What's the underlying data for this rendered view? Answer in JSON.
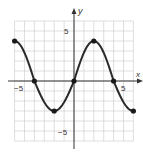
{
  "chart_data": {
    "type": "line",
    "title": "",
    "xlabel": "x",
    "ylabel": "y",
    "xlim": [
      -6,
      6
    ],
    "ylim": [
      -6,
      6
    ],
    "grid": true,
    "x_tick_labels": [
      {
        "value": -5,
        "label": "-5"
      },
      {
        "value": 5,
        "label": "5"
      }
    ],
    "y_tick_labels": [
      {
        "value": 5,
        "label": "5"
      },
      {
        "value": -5,
        "label": "-5"
      }
    ],
    "series": [
      {
        "name": "f(x)",
        "style": "smooth periodic curve",
        "points": [
          {
            "x": -6,
            "y": 4
          },
          {
            "x": -4,
            "y": 0
          },
          {
            "x": -2,
            "y": -3
          },
          {
            "x": 0,
            "y": 0
          },
          {
            "x": 2,
            "y": 4
          },
          {
            "x": 4,
            "y": 0
          },
          {
            "x": 6,
            "y": -3
          }
        ]
      }
    ],
    "marked_points": [
      {
        "x": -6,
        "y": 4
      },
      {
        "x": -4,
        "y": 0
      },
      {
        "x": -2,
        "y": -3
      },
      {
        "x": 0,
        "y": 0
      },
      {
        "x": 2,
        "y": 4
      },
      {
        "x": 4,
        "y": 0
      },
      {
        "x": 6,
        "y": -3
      }
    ]
  },
  "labels": {
    "x_axis": "x",
    "y_axis": "y",
    "x_neg5": "−5",
    "x_pos5": "5",
    "y_pos5": "5",
    "y_neg5": "−5"
  },
  "colors": {
    "curve": "#2a2a2a",
    "grid": "#c9c9c9",
    "axis": "#333333",
    "background": "#ffffff"
  }
}
